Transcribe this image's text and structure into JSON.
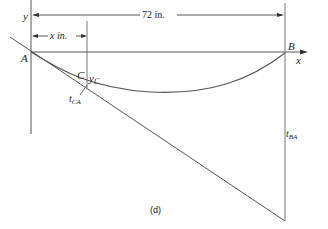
{
  "diagram": {
    "caption": "(d)",
    "axes": {
      "x_label": "x",
      "y_label": "y"
    },
    "points": {
      "A": "A",
      "B": "B",
      "C": "C"
    },
    "dimensions": {
      "span": "72 in.",
      "x_dim": "x in."
    },
    "annotations": {
      "y_c_main": "y",
      "y_c_sub": "C",
      "t_ca_main": "t",
      "t_ca_sub": "CA",
      "t_ba_main": "t",
      "t_ba_sub": "BA"
    },
    "colors": {
      "line": "#555555",
      "text": "#222222",
      "background": "#ffffff"
    }
  }
}
